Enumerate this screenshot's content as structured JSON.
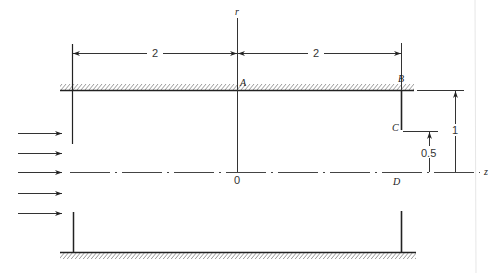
{
  "figure": {
    "axes": {
      "r_label": "r",
      "z_label": "z",
      "origin_label": "0"
    },
    "points": {
      "A": "A",
      "B": "B",
      "C": "C",
      "D": "D"
    },
    "dimensions": {
      "left_span": "2",
      "right_span": "2",
      "wall_height": "1",
      "step_height": "0.5"
    },
    "inflow_arrows": 5,
    "colors": {
      "line": "#222222",
      "background": "#ffffff"
    }
  }
}
